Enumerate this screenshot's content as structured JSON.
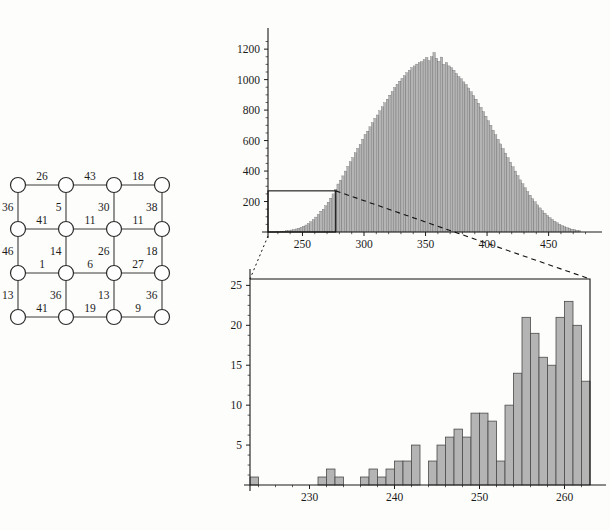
{
  "figure": {
    "panels": [
      "grid-graph",
      "histogram-full",
      "histogram-inset-detail"
    ],
    "colors": {
      "bar_fill": "#b4b4b4",
      "bar_stroke": "#4a4a4a",
      "axis": "#1b1b1b",
      "node_fill": "#ffffff",
      "node_stroke": "#2b2b2b",
      "edge": "#3a3a3a",
      "connector": "#111111",
      "background": "#fdfdfb"
    }
  },
  "graph": {
    "name": "weighted-4x4-grid-graph",
    "rows": 4,
    "cols": 4,
    "node_count": 16,
    "nodes": [
      {
        "id": "n00",
        "row": 0,
        "col": 0
      },
      {
        "id": "n01",
        "row": 0,
        "col": 1
      },
      {
        "id": "n02",
        "row": 0,
        "col": 2
      },
      {
        "id": "n03",
        "row": 0,
        "col": 3
      },
      {
        "id": "n10",
        "row": 1,
        "col": 0
      },
      {
        "id": "n11",
        "row": 1,
        "col": 1
      },
      {
        "id": "n12",
        "row": 1,
        "col": 2
      },
      {
        "id": "n13",
        "row": 1,
        "col": 3
      },
      {
        "id": "n20",
        "row": 2,
        "col": 0
      },
      {
        "id": "n21",
        "row": 2,
        "col": 1
      },
      {
        "id": "n22",
        "row": 2,
        "col": 2
      },
      {
        "id": "n23",
        "row": 2,
        "col": 3
      },
      {
        "id": "n30",
        "row": 3,
        "col": 0
      },
      {
        "id": "n31",
        "row": 3,
        "col": 1
      },
      {
        "id": "n32",
        "row": 3,
        "col": 2
      },
      {
        "id": "n33",
        "row": 3,
        "col": 3
      }
    ],
    "horizontal_edge_weights": [
      [
        26,
        43,
        18
      ],
      [
        41,
        11,
        11
      ],
      [
        1,
        6,
        27
      ],
      [
        41,
        19,
        9
      ]
    ],
    "vertical_edge_weights": [
      [
        36,
        5,
        30,
        38
      ],
      [
        46,
        14,
        26,
        18
      ],
      [
        13,
        36,
        13,
        36
      ]
    ],
    "all_weights": [
      26,
      43,
      18,
      36,
      5,
      30,
      38,
      41,
      11,
      11,
      46,
      14,
      26,
      18,
      1,
      6,
      27,
      13,
      36,
      13,
      36,
      41,
      19,
      9
    ],
    "weight_sum": 584
  },
  "chart_data": [
    {
      "id": "histogram-full",
      "type": "bar",
      "title": "",
      "xlabel": "",
      "ylabel": "",
      "xlim": [
        222,
        482
      ],
      "ylim": [
        0,
        1260
      ],
      "xticks": [
        250,
        300,
        350,
        400,
        450
      ],
      "yticks": [
        200,
        400,
        600,
        800,
        1000,
        1200
      ],
      "xtick_labels": [
        "250",
        "300",
        "350",
        "400",
        "450"
      ],
      "ytick_labels": [
        "200",
        "400",
        "600",
        "800",
        "1000",
        "1200"
      ],
      "grid": false,
      "legend": null,
      "bin_width": 2,
      "bin_starts": [
        222,
        224,
        226,
        228,
        230,
        232,
        234,
        236,
        238,
        240,
        242,
        244,
        246,
        248,
        250,
        252,
        254,
        256,
        258,
        260,
        262,
        264,
        266,
        268,
        270,
        272,
        274,
        276,
        278,
        280,
        282,
        284,
        286,
        288,
        290,
        292,
        294,
        296,
        298,
        300,
        302,
        304,
        306,
        308,
        310,
        312,
        314,
        316,
        318,
        320,
        322,
        324,
        326,
        328,
        330,
        332,
        334,
        336,
        338,
        340,
        342,
        344,
        346,
        348,
        350,
        352,
        354,
        356,
        358,
        360,
        362,
        364,
        366,
        368,
        370,
        372,
        374,
        376,
        378,
        380,
        382,
        384,
        386,
        388,
        390,
        392,
        394,
        396,
        398,
        400,
        402,
        404,
        406,
        408,
        410,
        412,
        414,
        416,
        418,
        420,
        422,
        424,
        426,
        428,
        430,
        432,
        434,
        436,
        438,
        440,
        442,
        444,
        446,
        448,
        450,
        452,
        454,
        456,
        458,
        460,
        462,
        464,
        466,
        468,
        470,
        472,
        474,
        476,
        478,
        480
      ],
      "values": [
        1,
        1,
        2,
        3,
        3,
        5,
        6,
        8,
        10,
        13,
        16,
        20,
        25,
        31,
        38,
        46,
        56,
        68,
        82,
        98,
        116,
        137,
        150,
        172,
        196,
        222,
        250,
        281,
        315,
        340,
        368,
        400,
        430,
        462,
        488,
        520,
        548,
        575,
        608,
        640,
        662,
        690,
        718,
        745,
        768,
        795,
        822,
        848,
        872,
        898,
        922,
        948,
        970,
        990,
        1008,
        1026,
        1045,
        1062,
        1078,
        1090,
        1102,
        1112,
        1118,
        1132,
        1145,
        1125,
        1150,
        1178,
        1140,
        1120,
        1148,
        1100,
        1112,
        1090,
        1078,
        1062,
        1040,
        1020,
        1005,
        985,
        968,
        945,
        920,
        895,
        872,
        845,
        818,
        790,
        760,
        730,
        700,
        668,
        638,
        608,
        578,
        548,
        518,
        488,
        458,
        428,
        400,
        370,
        342,
        316,
        290,
        265,
        242,
        218,
        198,
        178,
        158,
        140,
        124,
        108,
        94,
        82,
        70,
        60,
        50,
        42,
        35,
        29,
        24,
        19,
        15,
        12,
        9
      ],
      "peak_value": 1178,
      "peak_x": 358,
      "inset_box": {
        "x_start": 222,
        "x_end": 277,
        "y_start": 0,
        "y_end": 270
      }
    },
    {
      "id": "histogram-inset-detail",
      "type": "bar",
      "title": "",
      "xlabel": "",
      "ylabel": "",
      "xlim": [
        223,
        263
      ],
      "ylim": [
        0,
        25.8
      ],
      "xticks": [
        230,
        240,
        250,
        260
      ],
      "yticks": [
        5,
        10,
        15,
        20,
        25
      ],
      "xtick_labels": [
        "230",
        "240",
        "250",
        "260"
      ],
      "ytick_labels": [
        "5",
        "10",
        "15",
        "20",
        "25"
      ],
      "grid": false,
      "legend": null,
      "bin_width": 1,
      "bin_starts": [
        223,
        224,
        225,
        226,
        227,
        228,
        229,
        230,
        231,
        232,
        233,
        234,
        235,
        236,
        237,
        238,
        239,
        240,
        241,
        242,
        243,
        244,
        245,
        246,
        247,
        248,
        249,
        250,
        251,
        252,
        253,
        254,
        255,
        256,
        257,
        258,
        259,
        260,
        261,
        262
      ],
      "values": [
        1,
        0,
        0,
        0,
        0,
        0,
        0,
        0,
        1,
        2,
        1,
        0,
        0,
        1,
        2,
        1,
        2,
        3,
        3,
        5,
        0,
        3,
        5,
        6,
        7,
        6,
        9,
        9,
        8,
        3,
        10,
        14,
        21,
        19,
        16,
        15,
        21,
        23,
        20,
        13
      ],
      "peak_value": 23,
      "peak_x": 260
    }
  ],
  "connectors": {
    "dashed_top_right": "from inset box top-right to detail chart top-right",
    "dotted_left": "from inset box left edge down to detail chart left edge",
    "style": "dashed"
  }
}
